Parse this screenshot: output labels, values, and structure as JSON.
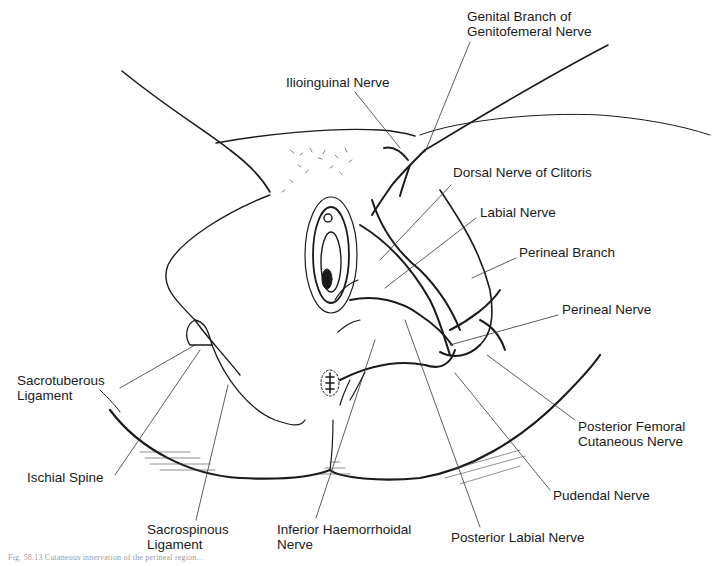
{
  "figure": {
    "type": "anatomical line illustration",
    "line_color": "#1a1a1a",
    "background": "#ffffff",
    "labels": [
      {
        "id": "genital-branch",
        "text_lines": [
          "Genital Branch of",
          "Genitofemeral Nerve"
        ],
        "x": 467,
        "y": 9
      },
      {
        "id": "ilioinguinal",
        "text_lines": [
          "Ilioinguinal Nerve"
        ],
        "x": 286,
        "y": 75
      },
      {
        "id": "dorsal-nerve-clitoris",
        "text_lines": [
          "Dorsal Nerve of Clitoris"
        ],
        "x": 453,
        "y": 165
      },
      {
        "id": "labial-nerve",
        "text_lines": [
          "Labial Nerve"
        ],
        "x": 480,
        "y": 205
      },
      {
        "id": "perineal-branch",
        "text_lines": [
          "Perineal Branch"
        ],
        "x": 519,
        "y": 245
      },
      {
        "id": "perineal-nerve",
        "text_lines": [
          "Perineal Nerve"
        ],
        "x": 562,
        "y": 302
      },
      {
        "id": "sacrotuberous-ligament",
        "text_lines": [
          "Sacrotuberous",
          "Ligament"
        ],
        "x": 17,
        "y": 373
      },
      {
        "id": "posterior-femoral-cutaneous",
        "text_lines": [
          "Posterior Femoral",
          "Cutaneous Nerve"
        ],
        "x": 578,
        "y": 419
      },
      {
        "id": "ischial-spine",
        "text_lines": [
          "Ischial Spine"
        ],
        "x": 27,
        "y": 470
      },
      {
        "id": "pudendal-nerve",
        "text_lines": [
          "Pudendal Nerve"
        ],
        "x": 553,
        "y": 488
      },
      {
        "id": "sacrospinous-ligament",
        "text_lines": [
          "Sacrospinous",
          "Ligament"
        ],
        "x": 147,
        "y": 522
      },
      {
        "id": "inferior-haemorrhoidal",
        "text_lines": [
          "Inferior Haemorrhoidal",
          "Nerve"
        ],
        "x": 277,
        "y": 522
      },
      {
        "id": "posterior-labial",
        "text_lines": [
          "Posterior Labial Nerve"
        ],
        "x": 451,
        "y": 530
      }
    ],
    "caption": "Fig. 58.13  Cutaneous innervation of the perineal region..."
  }
}
